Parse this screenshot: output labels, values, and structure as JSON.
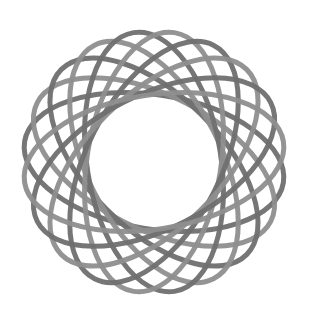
{
  "figure": {
    "type": "spirograph-rosette",
    "center": [
      154,
      162
    ],
    "ellipse_count": 10,
    "semi_major": 131,
    "semi_minor": 67,
    "stroke_width": 5,
    "colors": [
      "#6f6f6f",
      "#8e8e8e"
    ],
    "background": "#ffffff"
  }
}
